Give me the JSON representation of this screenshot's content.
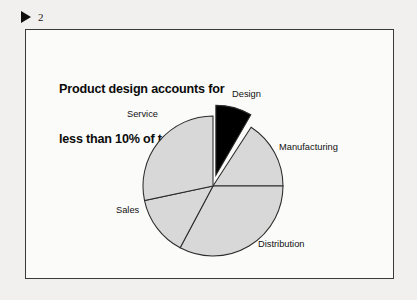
{
  "slide": {
    "marker_icon": "play-triangle-icon",
    "number": "2",
    "headline_line1": "Product design accounts for",
    "headline_line2": "less than 10% of total cost"
  },
  "colors": {
    "page_background": "#f1f0ee",
    "slide_background": "#fbfbfa",
    "frame_border": "#3a3a3a",
    "slice_fill": "#d8d8d8",
    "slice_stroke": "#2b2b2b",
    "highlight_fill": "#000000",
    "text": "#0b0b0b"
  },
  "chart_data": {
    "type": "pie",
    "title": "Product design accounts for less than 10% of total cost",
    "subtitle": "",
    "xlabel": "",
    "ylabel": "",
    "legend_position": "none",
    "grid": false,
    "labels_outside": true,
    "exploded_slice": "Design",
    "center": {
      "x": 213,
      "y": 186
    },
    "radius": 70,
    "categories": [
      "Design",
      "Manufacturing",
      "Distribution",
      "Sales",
      "Service"
    ],
    "values": [
      8,
      16,
      33,
      14,
      29
    ],
    "slices": [
      {
        "name": "Design",
        "label": "Design",
        "value": 8,
        "start_angle": 0,
        "end_angle": 30,
        "fill": "#000000",
        "exploded": true,
        "explode_offset": 11,
        "label_x": 232,
        "label_y": 90
      },
      {
        "name": "Manufacturing",
        "label": "Manufacturing",
        "value": 16,
        "start_angle": 33,
        "end_angle": 90,
        "fill": "#d8d8d8",
        "exploded": false,
        "explode_offset": 0,
        "label_x": 279,
        "label_y": 143
      },
      {
        "name": "Distribution",
        "label": "Distribution",
        "value": 33,
        "start_angle": 90,
        "end_angle": 208,
        "fill": "#d8d8d8",
        "exploded": false,
        "explode_offset": 0,
        "label_x": 258,
        "label_y": 240
      },
      {
        "name": "Sales",
        "label": "Sales",
        "value": 14,
        "start_angle": 208,
        "end_angle": 258,
        "fill": "#d8d8d8",
        "exploded": false,
        "explode_offset": 0,
        "label_x": 116,
        "label_y": 206
      },
      {
        "name": "Service",
        "label": "Service",
        "value": 29,
        "start_angle": 258,
        "end_angle": 360,
        "fill": "#d8d8d8",
        "exploded": false,
        "explode_offset": 0,
        "label_x": 127,
        "label_y": 110
      }
    ]
  }
}
